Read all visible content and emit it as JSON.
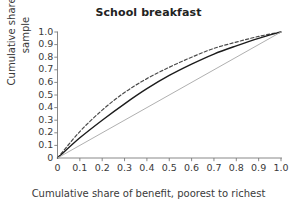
{
  "chart_data": {
    "type": "line",
    "title": "School breakfast",
    "xlabel": "Cumulative share of benefit, poorest to richest",
    "ylabel": "Cumulative share of sample",
    "xlim": [
      0,
      1
    ],
    "ylim": [
      0,
      1
    ],
    "grid": false,
    "legend": "none",
    "xticks": [
      "0",
      "0.1",
      "0.2",
      "0.3",
      "0.4",
      "0.5",
      "0.6",
      "0.7",
      "0.8",
      "0.9",
      "1.0"
    ],
    "xtick_values": [
      0,
      0.1,
      0.2,
      0.3,
      0.4,
      0.5,
      0.6,
      0.7,
      0.8,
      0.9,
      1.0
    ],
    "yticks": [
      "0",
      "0.1",
      "0.2",
      "0.3",
      "0.4",
      "0.5",
      "0.6",
      "0.7",
      "0.8",
      "0.9",
      "1.0"
    ],
    "ytick_values": [
      0,
      0.1,
      0.2,
      0.3,
      0.4,
      0.5,
      0.6,
      0.7,
      0.8,
      0.9,
      1.0
    ],
    "x": [
      0,
      0.1,
      0.2,
      0.3,
      0.4,
      0.5,
      0.6,
      0.7,
      0.8,
      0.9,
      1.0
    ],
    "series": [
      {
        "name": "dashed-curve",
        "style": "dashed",
        "color": "#4a4a4a",
        "width": 1.2,
        "values": [
          0,
          0.21,
          0.38,
          0.52,
          0.63,
          0.72,
          0.8,
          0.87,
          0.92,
          0.965,
          1.0
        ]
      },
      {
        "name": "solid-curve",
        "style": "solid",
        "color": "#1c1c1c",
        "width": 1.4,
        "values": [
          0,
          0.16,
          0.3,
          0.43,
          0.55,
          0.655,
          0.745,
          0.825,
          0.89,
          0.95,
          1.0
        ]
      },
      {
        "name": "equality-line",
        "style": "solid",
        "color": "#b0b0b0",
        "width": 1.0,
        "values": [
          0,
          0.1,
          0.2,
          0.3,
          0.4,
          0.5,
          0.6,
          0.7,
          0.8,
          0.9,
          1.0
        ]
      }
    ],
    "axis_color": "#7a7a7a"
  }
}
